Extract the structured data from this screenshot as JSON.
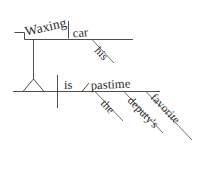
{
  "diagram": {
    "type": "sentence-diagram",
    "style": "Reed-Kellogg",
    "sentence": "Waxing his car is the deputy's favorite pastime.",
    "ink_color": "#3a3a3a",
    "text_color": "#2b2b2b",
    "background_color": "#ffffff",
    "words": {
      "gerund": "Waxing",
      "gerund_object": "car",
      "gerund_object_modifier": "his",
      "verb": "is",
      "subject_complement": "pastime",
      "complement_modifier_1": "the",
      "complement_modifier_2": "deputy's",
      "complement_modifier_3": "favorite"
    },
    "parts": [
      {
        "label": "Waxing",
        "role": "gerund",
        "placement": "stepped-gerund-line"
      },
      {
        "label": "car",
        "role": "direct-object-of-gerund",
        "placement": "upper-baseline"
      },
      {
        "label": "his",
        "role": "possessive-modifier",
        "placement": "diagonal-under-car"
      },
      {
        "label": "is",
        "role": "linking-verb",
        "placement": "main-baseline"
      },
      {
        "label": "pastime",
        "role": "predicate-nominative",
        "placement": "main-baseline"
      },
      {
        "label": "the",
        "role": "article-modifier",
        "placement": "diagonal-under-pastime"
      },
      {
        "label": "deputy's",
        "role": "possessive-modifier",
        "placement": "diagonal-under-pastime"
      },
      {
        "label": "favorite",
        "role": "adjective-modifier",
        "placement": "diagonal-under-pastime"
      }
    ]
  }
}
